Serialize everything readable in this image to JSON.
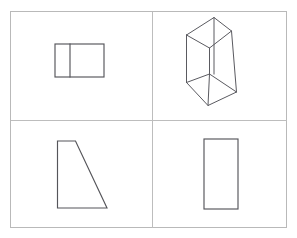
{
  "figure": {
    "background_color": "#ffffff",
    "frame": {
      "name": "outer-border",
      "stroke_color": "#b9b9b9",
      "x": 10,
      "y": 11,
      "width": 277,
      "height": 217
    },
    "dividers": {
      "stroke_color": "#bdbdbd",
      "vertical_x": 152.5,
      "horizontal_y": 120.5
    },
    "shape_stroke_color": "#55555a",
    "panels": [
      {
        "id": "top-left",
        "label": "top-view-rectangle-with-divider",
        "shape_type": "rectangle-divided",
        "points": [
          [
            55,
            44
          ],
          [
            104,
            44
          ],
          [
            104,
            77
          ],
          [
            55,
            77
          ]
        ],
        "interior_lines": [
          [
            [
              70,
              44
            ],
            [
              70,
              77
            ]
          ]
        ]
      },
      {
        "id": "top-right",
        "label": "isometric-trapezoidal-prism",
        "shape_type": "isometric-prism",
        "points": [
          [
            186.5,
            82.5
          ],
          [
            186.5,
            35.0
          ],
          [
            214.0,
            17.5
          ],
          [
            214.0,
            74.0
          ],
          [
            236.5,
            92.0
          ],
          [
            208.0,
            105.5
          ],
          [
            231.5,
            31.0
          ],
          [
            209.5,
            74.0
          ]
        ],
        "edges": [
          [
            [
              186.5,
              35.0
            ],
            [
              214.0,
              17.5
            ]
          ],
          [
            [
              214.0,
              17.5
            ],
            [
              231.5,
              31.0
            ]
          ],
          [
            [
              186.5,
              35.0
            ],
            [
              209.5,
              48.0
            ]
          ],
          [
            [
              209.5,
              48.0
            ],
            [
              231.5,
              31.0
            ]
          ],
          [
            [
              186.5,
              35.0
            ],
            [
              186.5,
              82.5
            ]
          ],
          [
            [
              214.0,
              17.5
            ],
            [
              214.0,
              74.0
            ]
          ],
          [
            [
              209.5,
              48.0
            ],
            [
              209.5,
              74.0
            ]
          ],
          [
            [
              186.5,
              82.5
            ],
            [
              209.5,
              74.0
            ]
          ],
          [
            [
              209.5,
              74.0
            ],
            [
              236.5,
              92.0
            ]
          ],
          [
            [
              231.5,
              31.0
            ],
            [
              236.5,
              92.0
            ]
          ],
          [
            [
              186.5,
              82.5
            ],
            [
              208.0,
              105.5
            ]
          ],
          [
            [
              208.0,
              105.5
            ],
            [
              236.5,
              92.0
            ]
          ],
          [
            [
              209.5,
              74.0
            ],
            [
              208.0,
              105.5
            ]
          ]
        ]
      },
      {
        "id": "bottom-left",
        "label": "side-view-trapezoid",
        "shape_type": "trapezoid",
        "points": [
          [
            57.5,
            141.0
          ],
          [
            75.5,
            141.0
          ],
          [
            107.0,
            208.0
          ],
          [
            57.5,
            208.0
          ]
        ]
      },
      {
        "id": "bottom-right",
        "label": "front-view-rectangle",
        "shape_type": "rectangle",
        "points": [
          [
            204.0,
            139.0
          ],
          [
            238.0,
            139.0
          ],
          [
            238.0,
            209.0
          ],
          [
            204.0,
            209.0
          ]
        ]
      }
    ]
  }
}
